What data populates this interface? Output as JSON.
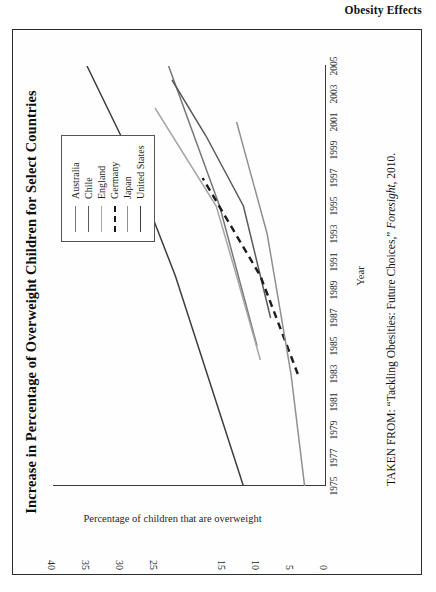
{
  "page": {
    "running_head": "Obesity Effects"
  },
  "figure": {
    "title": "Increase in Percentage of Overweight Children for Select Countries",
    "source_prefix": "TAKEN FROM: “Tackling Obesities: Future Choices,” ",
    "source_italic": "Foresight",
    "source_suffix": ", 2010."
  },
  "chart_data": {
    "type": "line",
    "title": "Increase in Percentage of Overweight Children for Select Countries",
    "xlabel": "Year",
    "ylabel": "Percentage of children that are overweight",
    "xlim": [
      1975,
      2005
    ],
    "ylim": [
      0,
      40
    ],
    "grid": false,
    "legend_position": "top-right",
    "x_ticks": [
      1975,
      1977,
      1979,
      1981,
      1983,
      1985,
      1987,
      1989,
      1991,
      1993,
      1995,
      1997,
      1999,
      2001,
      2003,
      2005
    ],
    "y_ticks": [
      0,
      5,
      10,
      15,
      25,
      30,
      35,
      40
    ],
    "y_ticks_note": "the 20 label is not printed on the axis",
    "series": [
      {
        "name": "Australia",
        "style": "solid",
        "color": "#777777",
        "x": [
          1985,
          1995,
          2005
        ],
        "values": [
          10.0,
          15.5,
          23.0
        ]
      },
      {
        "name": "Chile",
        "style": "solid",
        "color": "#5a5a5a",
        "x": [
          1987,
          1993,
          1995,
          2000,
          2004
        ],
        "values": [
          8.0,
          11.0,
          12.0,
          17.5,
          22.5
        ]
      },
      {
        "name": "England",
        "style": "solid",
        "color": "#a6a6a6",
        "x": [
          1984,
          1990,
          1995,
          2002
        ],
        "values": [
          9.5,
          13.0,
          16.0,
          25.0
        ]
      },
      {
        "name": "Germany",
        "style": "dashed",
        "color": "#1a1a1a",
        "x": [
          1983,
          1990,
          1997
        ],
        "values": [
          4.0,
          9.5,
          18.0
        ]
      },
      {
        "name": "Japan",
        "style": "solid",
        "color": "#8f8f8f",
        "x": [
          1975,
          1983,
          1993,
          2001
        ],
        "values": [
          3.0,
          5.0,
          8.5,
          13.0
        ]
      },
      {
        "name": "United States",
        "style": "solid",
        "color": "#3d3d3d",
        "x": [
          1975,
          1990,
          2000,
          2005
        ],
        "values": [
          12.0,
          22.0,
          30.0,
          35.0
        ]
      }
    ]
  }
}
